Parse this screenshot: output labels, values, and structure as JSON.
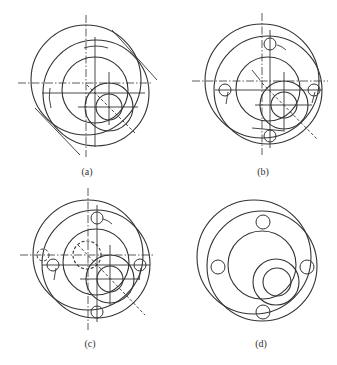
{
  "figure": {
    "stroke_color": "#333333",
    "background": "#ffffff",
    "panels": [
      {
        "id": "a",
        "caption": "(a)",
        "caption_pos": [
          87,
          166
        ],
        "circles": [
          {
            "cx": 86,
            "cy": 80,
            "r": 55,
            "style": "solid"
          },
          {
            "cx": 96,
            "cy": 93,
            "r": 53,
            "style": "solid"
          },
          {
            "cx": 95,
            "cy": 90,
            "r": 33,
            "style": "solid"
          },
          {
            "cx": 109,
            "cy": 107,
            "r": 24,
            "style": "solid"
          },
          {
            "cx": 109,
            "cy": 107,
            "r": 13,
            "style": "solid"
          }
        ],
        "lines": [
          {
            "x1": 86,
            "y1": 15,
            "x2": 86,
            "y2": 157,
            "style": "center"
          },
          {
            "x1": 18,
            "y1": 83,
            "x2": 152,
            "y2": 83,
            "style": "center"
          },
          {
            "x1": 95,
            "y1": 37,
            "x2": 95,
            "y2": 147,
            "style": "solid"
          },
          {
            "x1": 42,
            "y1": 93,
            "x2": 145,
            "y2": 93,
            "style": "solid"
          },
          {
            "x1": 109,
            "y1": 72,
            "x2": 109,
            "y2": 125,
            "style": "solid"
          },
          {
            "x1": 78,
            "y1": 107,
            "x2": 138,
            "y2": 107,
            "style": "solid"
          },
          {
            "x1": 112,
            "y1": 30,
            "x2": 157,
            "y2": 80,
            "style": "solid"
          },
          {
            "x1": 35,
            "y1": 108,
            "x2": 80,
            "y2": 155,
            "style": "solid"
          },
          {
            "x1": 87,
            "y1": 85,
            "x2": 135,
            "y2": 133,
            "style": "dashed"
          }
        ],
        "arcs": [
          {
            "d": "M 84 48 Q 96 44 108 48"
          },
          {
            "d": "M 50 88 Q 48 98 51 108"
          }
        ]
      },
      {
        "id": "b",
        "caption": "(b)",
        "caption_pos": [
          263,
          166
        ],
        "circles": [
          {
            "cx": 262,
            "cy": 81,
            "r": 57,
            "style": "solid"
          },
          {
            "cx": 268,
            "cy": 90,
            "r": 54,
            "style": "solid"
          },
          {
            "cx": 268,
            "cy": 89,
            "r": 32,
            "style": "solid"
          },
          {
            "cx": 284,
            "cy": 105,
            "r": 24,
            "style": "solid"
          },
          {
            "cx": 284,
            "cy": 105,
            "r": 13,
            "style": "solid"
          },
          {
            "cx": 270,
            "cy": 44,
            "r": 6,
            "style": "solid"
          },
          {
            "cx": 225,
            "cy": 90,
            "r": 6,
            "style": "solid"
          },
          {
            "cx": 314,
            "cy": 90,
            "r": 6,
            "style": "solid"
          },
          {
            "cx": 270,
            "cy": 136,
            "r": 6,
            "style": "solid"
          }
        ],
        "lines": [
          {
            "x1": 262,
            "y1": 13,
            "x2": 262,
            "y2": 155,
            "style": "center"
          },
          {
            "x1": 192,
            "y1": 81,
            "x2": 328,
            "y2": 81,
            "style": "center"
          },
          {
            "x1": 270,
            "y1": 30,
            "x2": 270,
            "y2": 148,
            "style": "solid"
          },
          {
            "x1": 215,
            "y1": 90,
            "x2": 322,
            "y2": 90,
            "style": "solid"
          },
          {
            "x1": 284,
            "y1": 72,
            "x2": 284,
            "y2": 130,
            "style": "solid"
          },
          {
            "x1": 255,
            "y1": 105,
            "x2": 312,
            "y2": 105,
            "style": "solid"
          },
          {
            "x1": 252,
            "y1": 70,
            "x2": 260,
            "y2": 80,
            "style": "solid"
          },
          {
            "x1": 262,
            "y1": 83,
            "x2": 318,
            "y2": 140,
            "style": "dashed"
          },
          {
            "x1": 252,
            "y1": 128,
            "x2": 285,
            "y2": 131,
            "style": "solid"
          },
          {
            "x1": 228,
            "y1": 92,
            "x2": 226,
            "y2": 104,
            "style": "solid"
          },
          {
            "x1": 315,
            "y1": 92,
            "x2": 312,
            "y2": 103,
            "style": "solid"
          }
        ],
        "arcs": [
          {
            "d": "M 277 45 Q 282 46 286 50"
          }
        ]
      },
      {
        "id": "c",
        "caption": "(c)",
        "caption_pos": [
          90,
          338
        ],
        "circles": [
          {
            "cx": 88,
            "cy": 255,
            "r": 55,
            "style": "solid"
          },
          {
            "cx": 96,
            "cy": 264,
            "r": 54,
            "style": "solid"
          },
          {
            "cx": 96,
            "cy": 262,
            "r": 33,
            "style": "solid"
          },
          {
            "cx": 110,
            "cy": 279,
            "r": 24,
            "style": "solid"
          },
          {
            "cx": 110,
            "cy": 279,
            "r": 13,
            "style": "solid"
          },
          {
            "cx": 87,
            "cy": 255,
            "r": 14,
            "style": "dashed"
          },
          {
            "cx": 43,
            "cy": 255,
            "r": 6,
            "style": "dashed"
          },
          {
            "cx": 97,
            "cy": 218,
            "r": 6,
            "style": "solid"
          },
          {
            "cx": 53,
            "cy": 265,
            "r": 6,
            "style": "solid"
          },
          {
            "cx": 140,
            "cy": 265,
            "r": 6,
            "style": "solid"
          },
          {
            "cx": 97,
            "cy": 312,
            "r": 6,
            "style": "solid"
          }
        ],
        "lines": [
          {
            "x1": 88,
            "y1": 188,
            "x2": 88,
            "y2": 330,
            "style": "center"
          },
          {
            "x1": 20,
            "y1": 255,
            "x2": 155,
            "y2": 255,
            "style": "center"
          },
          {
            "x1": 97,
            "y1": 205,
            "x2": 97,
            "y2": 322,
            "style": "solid"
          },
          {
            "x1": 42,
            "y1": 265,
            "x2": 150,
            "y2": 265,
            "style": "solid"
          },
          {
            "x1": 110,
            "y1": 245,
            "x2": 110,
            "y2": 305,
            "style": "solid"
          },
          {
            "x1": 80,
            "y1": 279,
            "x2": 140,
            "y2": 279,
            "style": "solid"
          },
          {
            "x1": 78,
            "y1": 245,
            "x2": 145,
            "y2": 315,
            "style": "dashed"
          },
          {
            "x1": 56,
            "y1": 268,
            "x2": 54,
            "y2": 280,
            "style": "solid"
          },
          {
            "x1": 141,
            "y1": 268,
            "x2": 139,
            "y2": 280,
            "style": "solid"
          }
        ],
        "arcs": [
          {
            "d": "M 103 219 Q 108 220 112 224"
          }
        ]
      },
      {
        "id": "d",
        "caption": "(d)",
        "caption_pos": [
          261,
          338
        ],
        "circles": [
          {
            "cx": 254,
            "cy": 257,
            "r": 57,
            "style": "solid"
          },
          {
            "cx": 262,
            "cy": 266,
            "r": 55,
            "style": "solid"
          },
          {
            "cx": 262,
            "cy": 265,
            "r": 34,
            "style": "solid"
          },
          {
            "cx": 276,
            "cy": 282,
            "r": 23,
            "style": "solid"
          },
          {
            "cx": 277,
            "cy": 282,
            "r": 14,
            "style": "solid"
          },
          {
            "cx": 263,
            "cy": 222,
            "r": 7,
            "style": "solid"
          },
          {
            "cx": 218,
            "cy": 267,
            "r": 7,
            "style": "solid"
          },
          {
            "cx": 307,
            "cy": 267,
            "r": 7,
            "style": "solid"
          },
          {
            "cx": 263,
            "cy": 312,
            "r": 7,
            "style": "solid"
          }
        ],
        "lines": [],
        "arcs": []
      }
    ]
  }
}
